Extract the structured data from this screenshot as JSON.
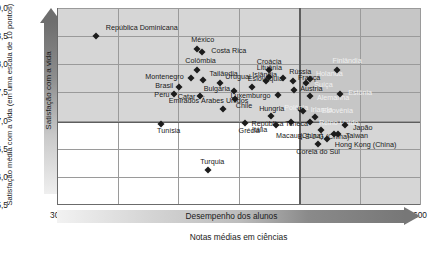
{
  "chart_data": {
    "type": "scatter",
    "title": "",
    "xlabel": "Notas médias em ciências",
    "ylabel": "Satisfação média com a vida (em uma escala de 10 pontos)",
    "xlim": [
      300,
      600
    ],
    "ylim": [
      5.5,
      9.0
    ],
    "xticks": [
      300,
      350,
      400,
      450,
      500,
      550,
      600
    ],
    "yticks": [
      "5,5",
      "6,0",
      "6,5",
      "7,0",
      "7,5",
      "8,0",
      "8,5",
      "9,0"
    ],
    "grid": true,
    "legend": "none",
    "annotations": {
      "x_arrow_label": "Desempenho dos alunos",
      "y_arrow_label": "Satisfação com a vida"
    },
    "shaded_regions": [
      {
        "name": "high-life-satisfaction-band",
        "orientation": "horizontal",
        "from_y": 6.98,
        "to_y": 9.0
      },
      {
        "name": "high-performance-band",
        "orientation": "vertical",
        "from_x": 500,
        "to_x": 600
      }
    ],
    "points": [
      {
        "label": "República Dominicana",
        "x": 332,
        "y": 8.51,
        "lx": 10,
        "ly": -8
      },
      {
        "label": "México",
        "x": 416,
        "y": 8.27,
        "lx": -6,
        "ly": -9
      },
      {
        "label": "Costa Rica",
        "x": 420,
        "y": 8.22,
        "lx": 9,
        "ly": -1
      },
      {
        "label": "Colômbia",
        "x": 416,
        "y": 7.89,
        "lx": -12,
        "ly": -9
      },
      {
        "label": "Montenegro",
        "x": 411,
        "y": 7.76,
        "lx": -46,
        "ly": -1
      },
      {
        "label": "Tailândia",
        "x": 421,
        "y": 7.72,
        "lx": 6,
        "ly": -6
      },
      {
        "label": "Brasil",
        "x": 401,
        "y": 7.59,
        "lx": -24,
        "ly": -1
      },
      {
        "label": "Peru",
        "x": 397,
        "y": 7.48,
        "lx": -20,
        "ly": 1
      },
      {
        "label": "Catar",
        "x": 418,
        "y": 7.43,
        "lx": -22,
        "ly": 1
      },
      {
        "label": "Croácia",
        "x": 475,
        "y": 7.9,
        "lx": -12,
        "ly": -8
      },
      {
        "label": "Lituânia",
        "x": 475,
        "y": 7.77,
        "lx": -12,
        "ly": -9
      },
      {
        "label": "Islândia",
        "x": 473,
        "y": 7.7,
        "lx": -14,
        "ly": -6
      },
      {
        "label": "Uruguai",
        "x": 435,
        "y": 7.66,
        "lx": 5,
        "ly": -6
      },
      {
        "label": "Rússia",
        "x": 487,
        "y": 7.76,
        "lx": 6,
        "ly": -6
      },
      {
        "label": "França",
        "x": 495,
        "y": 7.71,
        "lx": 5,
        "ly": -3
      },
      {
        "label": "Eslováquia",
        "x": 461,
        "y": 7.59,
        "lx": -4,
        "ly": -8
      },
      {
        "label": "Bulgária",
        "x": 446,
        "y": 7.52,
        "lx": -30,
        "ly": -2
      },
      {
        "label": "Luxemburgo",
        "x": 483,
        "y": 7.45,
        "lx": -48,
        "ly": 1
      },
      {
        "label": "Chile",
        "x": 447,
        "y": 7.38,
        "lx": 1,
        "ly": 7
      },
      {
        "label": "Holanda",
        "x": 509,
        "y": 7.73,
        "lx": 6,
        "ly": -5
      },
      {
        "label": "Suíça",
        "x": 506,
        "y": 7.67,
        "lx": 8,
        "ly": 2
      },
      {
        "label": "Áustria",
        "x": 496,
        "y": 7.54,
        "lx": 6,
        "ly": -1
      },
      {
        "label": "Alemanha",
        "x": 509,
        "y": 7.44,
        "lx": 7,
        "ly": 2
      },
      {
        "label": "Estônia",
        "x": 534,
        "y": 7.48,
        "lx": 8,
        "ly": -1
      },
      {
        "label": "Finlândia",
        "x": 531,
        "y": 7.89,
        "lx": -4,
        "ly": -9
      },
      {
        "label": "Emirados Árabes Unidos",
        "x": 437,
        "y": 7.21,
        "lx": -54,
        "ly": -8
      },
      {
        "label": "Polônia",
        "x": 501,
        "y": 7.21,
        "lx": -16,
        "ly": -1
      },
      {
        "label": "Irlanda",
        "x": 503,
        "y": 7.17,
        "lx": 8,
        "ly": -1
      },
      {
        "label": "Hungria",
        "x": 477,
        "y": 7.09,
        "lx": -12,
        "ly": -7
      },
      {
        "label": "Eslovênia",
        "x": 513,
        "y": 7.07,
        "lx": 7,
        "ly": -6
      },
      {
        "label": "Tunísia",
        "x": 386,
        "y": 6.94,
        "lx": -4,
        "ly": 7
      },
      {
        "label": "Grécia",
        "x": 455,
        "y": 6.95,
        "lx": -6,
        "ly": 8
      },
      {
        "label": "República Tcheca",
        "x": 493,
        "y": 6.97,
        "lx": -39,
        "ly": 2
      },
      {
        "label": "Itália",
        "x": 481,
        "y": 6.92,
        "lx": -24,
        "ly": 5
      },
      {
        "label": "Reino Unido",
        "x": 509,
        "y": 6.98,
        "lx": 9,
        "ly": 1
      },
      {
        "label": "Japão",
        "x": 538,
        "y": 6.92,
        "lx": 8,
        "ly": 3
      },
      {
        "label": "B-S-J-G (China)",
        "x": 518,
        "y": 6.83,
        "lx": -23,
        "ly": 7
      },
      {
        "label": "Macau (China)",
        "x": 529,
        "y": 6.76,
        "lx": -58,
        "ly": 2
      },
      {
        "label": "Taiwan",
        "x": 532,
        "y": 6.76,
        "lx": 8,
        "ly": 2
      },
      {
        "label": "Hong Kong (China)",
        "x": 523,
        "y": 6.67,
        "lx": 8,
        "ly": 6
      },
      {
        "label": "Coreia do Sul",
        "x": 516,
        "y": 6.59,
        "lx": -22,
        "ly": 8
      },
      {
        "label": "Turquia",
        "x": 425,
        "y": 6.12,
        "lx": -8,
        "ly": -8
      }
    ]
  }
}
